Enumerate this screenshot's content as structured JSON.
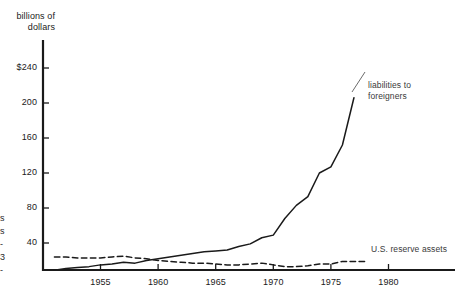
{
  "figure": {
    "background_color": "#ffffff",
    "ink_color": "#1a1a1a",
    "axis_title": "billions of\ndollars",
    "left_edge_fragment": "s\ns\n-\n3\n-"
  },
  "chart_data": {
    "type": "line",
    "title": "",
    "subtitle": "",
    "xlabel": "",
    "ylabel": "billions of dollars",
    "ylim": [
      0,
      260
    ],
    "xlim": [
      1951,
      1982
    ],
    "grid": false,
    "legend_position": "inline-right",
    "yticks": [
      40,
      80,
      120,
      160,
      200,
      240
    ],
    "ytick_labels": [
      "40",
      "80",
      "120",
      "160",
      "200",
      "$240"
    ],
    "xticks": [
      1955,
      1960,
      1965,
      1970,
      1975,
      1980
    ],
    "xtick_labels": [
      "1955",
      "1960",
      "1965",
      "1970",
      "1975",
      "1980"
    ],
    "series": [
      {
        "name": "liabilities to foreigners",
        "style": "solid",
        "color": "#1a1a1a",
        "label_text": "liabilities to\nforeigners",
        "x": [
          1951,
          1952,
          1953,
          1954,
          1955,
          1956,
          1957,
          1958,
          1959,
          1960,
          1961,
          1962,
          1963,
          1964,
          1965,
          1966,
          1967,
          1968,
          1969,
          1970,
          1971,
          1972,
          1973,
          1974,
          1975,
          1976,
          1977
        ],
        "y": [
          9,
          11,
          12,
          13,
          15,
          16,
          18,
          17,
          20,
          22,
          24,
          26,
          28,
          30,
          31,
          32,
          36,
          39,
          46,
          49,
          68,
          83,
          93,
          120,
          127,
          152,
          206
        ]
      },
      {
        "name": "U.S. reserve assets",
        "style": "dashed",
        "color": "#1a1a1a",
        "label_text": "U.S. reserve assets",
        "x": [
          1951,
          1952,
          1953,
          1954,
          1955,
          1956,
          1957,
          1958,
          1959,
          1960,
          1961,
          1962,
          1963,
          1964,
          1965,
          1966,
          1967,
          1968,
          1969,
          1970,
          1971,
          1972,
          1973,
          1974,
          1975,
          1976,
          1977,
          1978
        ],
        "y": [
          24,
          24,
          23,
          23,
          23,
          24,
          25,
          23,
          22,
          20,
          19,
          18,
          17,
          17,
          16,
          15,
          15,
          16,
          17,
          15,
          13,
          13,
          14,
          16,
          16,
          19,
          19,
          19
        ]
      }
    ]
  }
}
